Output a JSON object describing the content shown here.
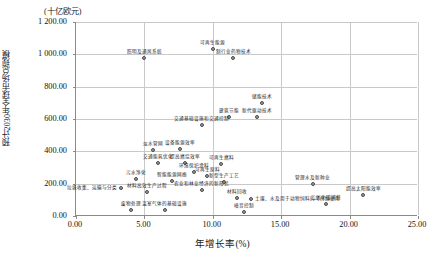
{
  "chart_data": {
    "type": "scatter",
    "title": "",
    "xlabel": "年增长率(%)",
    "ylabel": "预计2030年全球市场总规模",
    "yunit": "(十亿欧元)",
    "xlim": [
      0,
      25
    ],
    "ylim": [
      0,
      1200
    ],
    "xticks": [
      "0.00",
      "5.00",
      "10.00",
      "15.00",
      "20.00",
      "25.00"
    ],
    "xtick_values": [
      0,
      5,
      10,
      15,
      20,
      25
    ],
    "yticks": [
      "0.00",
      "200.00",
      "400.00",
      "600.00",
      "800.00",
      "1 000.00",
      "1 200.00"
    ],
    "ytick_values": [
      0,
      200,
      400,
      600,
      800,
      1000,
      1200
    ],
    "grid": true,
    "legend": false,
    "points": [
      {
        "label": "照明及通风系统",
        "x": 5.0,
        "y": 975,
        "pos": "top"
      },
      {
        "label": "可再生能源",
        "x": 10.0,
        "y": 1035,
        "pos": "top"
      },
      {
        "label": "制行业药物技术",
        "x": 11.5,
        "y": 975,
        "pos": "top"
      },
      {
        "label": "储能技术",
        "x": 13.6,
        "y": 700,
        "pos": "top"
      },
      {
        "label": "建筑节能",
        "x": 11.2,
        "y": 610,
        "pos": "top"
      },
      {
        "label": "新代驱动技术",
        "x": 13.2,
        "y": 613,
        "pos": "top"
      },
      {
        "label": "交通基础设施和交通控制",
        "x": 9.2,
        "y": 560,
        "pos": "top"
      },
      {
        "label": "淡水管网",
        "x": 5.6,
        "y": 410,
        "pos": "top"
      },
      {
        "label": "设备能源效率",
        "x": 7.6,
        "y": 415,
        "pos": "top"
      },
      {
        "label": "交通能耗优化",
        "x": 6.0,
        "y": 330,
        "pos": "top"
      },
      {
        "label": "提高燃烧效率",
        "x": 8.0,
        "y": 325,
        "pos": "top"
      },
      {
        "label": "可再生燃料",
        "x": 10.6,
        "y": 320,
        "pos": "top"
      },
      {
        "label": "环境保护涂料",
        "x": 8.6,
        "y": 270,
        "pos": "top"
      },
      {
        "label": "污水净化",
        "x": 4.4,
        "y": 230,
        "pos": "top"
      },
      {
        "label": "智能能源网络",
        "x": 7.0,
        "y": 215,
        "pos": "top"
      },
      {
        "label": "可再生原料",
        "x": 9.6,
        "y": 245,
        "pos": "top"
      },
      {
        "label": "新型生产工艺",
        "x": 10.8,
        "y": 210,
        "pos": "top"
      },
      {
        "label": "垃圾收集、运输与分类",
        "x": 3.3,
        "y": 175,
        "pos": "left"
      },
      {
        "label": "材料高效生产过程",
        "x": 5.2,
        "y": 150,
        "pos": "top"
      },
      {
        "label": "农业和林业经济的新形式",
        "x": 9.2,
        "y": 160,
        "pos": "top"
      },
      {
        "label": "材料回收",
        "x": 11.8,
        "y": 110,
        "pos": "top"
      },
      {
        "label": "土壤、水及用于动物饲料的可持续使用",
        "x": 12.8,
        "y": 105,
        "pos": "right"
      },
      {
        "label": "废物处理",
        "x": 4.0,
        "y": 40,
        "pos": "top"
      },
      {
        "label": "温室气体的基础设施",
        "x": 6.5,
        "y": 35,
        "pos": "top"
      },
      {
        "label": "噪音控制",
        "x": 12.3,
        "y": 25,
        "pos": "top"
      },
      {
        "label": "管理水及新种业",
        "x": 17.3,
        "y": 195,
        "pos": "top"
      },
      {
        "label": "提高太阳能效率",
        "x": 21.0,
        "y": 130,
        "pos": "top"
      },
      {
        "label": "二氧化碳捕获",
        "x": 18.3,
        "y": 75,
        "pos": "top"
      }
    ]
  }
}
